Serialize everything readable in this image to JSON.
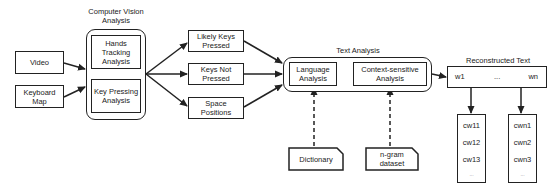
{
  "inputs": {
    "video": "Video",
    "keyboard_map": "Keyboard Map"
  },
  "computer_vision": {
    "title": "Computer Vision Analysis",
    "hands_tracking": "Hands Tracking Analysis",
    "key_pressing": "Key Pressing Analysis"
  },
  "outputs": {
    "likely_keys": "Likely Keys Pressed",
    "keys_not": "Keys Not Pressed",
    "space_positions": "Space Positions"
  },
  "text_analysis": {
    "title": "Text Analysis",
    "language": "Language Analysis",
    "context": "Context-sensitive Analysis"
  },
  "resources": {
    "dictionary": "Dictionary",
    "ngram": "n-gram dataset"
  },
  "reconstructed": {
    "title": "Reconstructed Text",
    "first_word": "w1",
    "ellipsis": "...",
    "last_word": "wn"
  },
  "candidates": {
    "first": [
      "cw11",
      "cw12",
      "cw13",
      "..."
    ],
    "last": [
      "cwn1",
      "cwn2",
      "cwn3",
      "..."
    ]
  }
}
